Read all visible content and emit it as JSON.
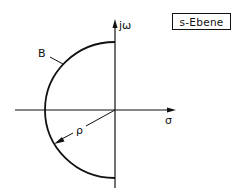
{
  "diagram": {
    "title_box": "s-Ebene",
    "axes": {
      "imag_label": "jω",
      "real_label": "σ"
    },
    "contour_label": "B",
    "radius_label": "ρ",
    "colors": {
      "ink": "#111111",
      "background": "#ffffff"
    }
  }
}
